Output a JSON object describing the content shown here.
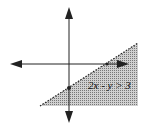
{
  "diagram": {
    "inequality_label": "2x - y > 3",
    "shade_color": "#b8b8b8",
    "axis_color": "#222222",
    "boundary_style": "dashed",
    "shaded_side": "below-right",
    "points": [
      {
        "name": "x-intercept",
        "label": ""
      },
      {
        "name": "y-intercept",
        "label": ""
      }
    ]
  }
}
